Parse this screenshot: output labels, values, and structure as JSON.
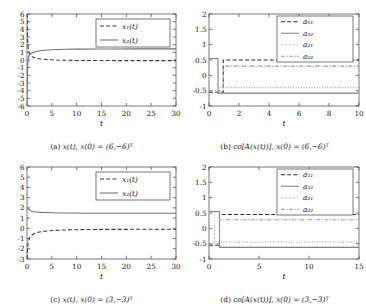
{
  "figure": {
    "panels": [
      {
        "tag": "(a)",
        "caption_main": "x(t), x(0) = (6,−6)",
        "caption_sup": "T",
        "xlabel": "t",
        "legend": [
          "x₁(t)",
          "x₂(t)"
        ]
      },
      {
        "tag": "(b)",
        "caption_main": "co[A(x(t))], x(0) = (6,−6)",
        "caption_sup": "T",
        "xlabel": "t",
        "legend": [
          "a₁₁",
          "a₁₂",
          "a₂₁",
          "a₂₂"
        ]
      },
      {
        "tag": "(c)",
        "caption_main": "x(t), x(0) = (3,−3)",
        "caption_sup": "T",
        "xlabel": "t",
        "legend": [
          "x₁(t)",
          "x₂(t)"
        ]
      },
      {
        "tag": "(d)",
        "caption_main": "co[A(x(t))], x(0) = (3,−3)",
        "caption_sup": "T",
        "xlabel": "t",
        "legend": [
          "a₁₁",
          "a₁₂",
          "a₂₁",
          "a₂₂"
        ]
      }
    ]
  },
  "chart_data": [
    {
      "type": "line",
      "title": "",
      "xlabel": "t",
      "ylabel": "",
      "xlim": [
        0,
        30
      ],
      "ylim": [
        -6,
        6
      ],
      "xticks": [
        0,
        5,
        10,
        15,
        20,
        25,
        30
      ],
      "yticks": [
        -6,
        -5,
        -4,
        -3,
        -2,
        -1,
        0,
        1,
        2,
        3,
        4,
        5,
        6
      ],
      "grid": false,
      "legend_position": "top-right",
      "series": [
        {
          "name": "x₁(t)",
          "style": "dashed",
          "color": "#3a3a3a",
          "x": [
            0,
            0.1,
            0.2,
            0.35,
            0.5,
            0.7,
            0.9,
            1.2,
            1.6,
            2,
            2.5,
            3,
            4,
            5,
            6,
            8,
            10,
            14,
            18,
            22,
            26,
            30
          ],
          "y": [
            6,
            3.1,
            1.85,
            1.15,
            0.85,
            0.62,
            0.5,
            0.38,
            0.28,
            0.22,
            0.16,
            0.12,
            0.06,
            0.02,
            -0.01,
            -0.04,
            -0.06,
            -0.07,
            -0.08,
            -0.08,
            -0.08,
            -0.08
          ]
        },
        {
          "name": "x₂(t)",
          "style": "solid",
          "color": "#6f6f6f",
          "x": [
            0,
            0.08,
            0.18,
            0.3,
            0.45,
            0.6,
            0.8,
            1,
            1.4,
            1.8,
            2.4,
            3,
            4,
            5,
            6,
            8,
            10,
            14,
            18,
            22,
            26,
            30
          ],
          "y": [
            -6,
            -2.1,
            -0.35,
            0.35,
            0.62,
            0.74,
            0.85,
            0.92,
            1.02,
            1.1,
            1.18,
            1.24,
            1.3,
            1.34,
            1.37,
            1.4,
            1.42,
            1.44,
            1.44,
            1.45,
            1.45,
            1.45
          ]
        }
      ]
    },
    {
      "type": "line",
      "title": "",
      "xlabel": "t",
      "ylabel": "",
      "xlim": [
        0,
        10
      ],
      "ylim": [
        -1,
        2
      ],
      "xticks": [
        0,
        2,
        4,
        6,
        8,
        10
      ],
      "yticks": [
        -1,
        -0.5,
        0,
        0.5,
        1,
        1.5,
        2
      ],
      "grid": false,
      "legend_position": "top-right",
      "series": [
        {
          "name": "a₁₁",
          "style": "dashed",
          "color": "#2b2b2b",
          "x": [
            0,
            0.95,
            0.95,
            10
          ],
          "y": [
            -0.55,
            -0.55,
            0.5,
            0.5
          ]
        },
        {
          "name": "a₁₂",
          "style": "solid",
          "color": "#808080",
          "x": [
            0,
            0.6,
            0.6,
            10
          ],
          "y": [
            0.55,
            0.55,
            -0.58,
            -0.58
          ]
        },
        {
          "name": "a₂₁",
          "style": "dotted",
          "color": "#b0b0b0",
          "x": [
            0,
            0.6,
            0.6,
            10
          ],
          "y": [
            0.5,
            0.5,
            -0.4,
            -0.4
          ]
        },
        {
          "name": "a₂₂",
          "style": "dashdot",
          "color": "#9a9a9a",
          "x": [
            0,
            0.95,
            0.95,
            10
          ],
          "y": [
            -0.5,
            -0.5,
            0.3,
            0.3
          ]
        }
      ]
    },
    {
      "type": "line",
      "title": "",
      "xlabel": "t",
      "ylabel": "",
      "xlim": [
        0,
        30
      ],
      "ylim": [
        -3,
        6
      ],
      "xticks": [
        0,
        5,
        10,
        15,
        20,
        25,
        30
      ],
      "yticks": [
        -3,
        -2,
        -1,
        0,
        1,
        2,
        3,
        4,
        5,
        6
      ],
      "grid": false,
      "legend_position": "top-right",
      "series": [
        {
          "name": "x₁(t)",
          "style": "dashed",
          "color": "#3a3a3a",
          "x": [
            0,
            0.15,
            0.3,
            0.5,
            0.8,
            1.2,
            1.8,
            2.5,
            3.5,
            5,
            7,
            9,
            12,
            16,
            20,
            25,
            30
          ],
          "y": [
            -3,
            -1.75,
            -1.25,
            -0.95,
            -0.72,
            -0.58,
            -0.45,
            -0.36,
            -0.28,
            -0.22,
            -0.17,
            -0.14,
            -0.12,
            -0.1,
            -0.1,
            -0.09,
            -0.09
          ]
        },
        {
          "name": "x₂(t)",
          "style": "solid",
          "color": "#6f6f6f",
          "x": [
            0,
            0.2,
            0.5,
            0.9,
            1.4,
            2,
            2.8,
            3.6,
            5,
            7,
            9,
            12,
            16,
            20,
            25,
            30
          ],
          "y": [
            2.05,
            1.95,
            1.8,
            1.7,
            1.63,
            1.59,
            1.56,
            1.54,
            1.52,
            1.5,
            1.49,
            1.48,
            1.48,
            1.47,
            1.47,
            1.47
          ]
        }
      ]
    },
    {
      "type": "line",
      "title": "",
      "xlabel": "t",
      "ylabel": "",
      "xlim": [
        0,
        15
      ],
      "ylim": [
        -1,
        2
      ],
      "xticks": [
        0,
        5,
        10,
        15
      ],
      "yticks": [
        -1,
        -0.5,
        0,
        0.5,
        1,
        1.5,
        2
      ],
      "grid": false,
      "legend_position": "top-right",
      "series": [
        {
          "name": "a₁₁",
          "style": "dashed",
          "color": "#2b2b2b",
          "x": [
            0,
            1.05,
            1.05,
            15
          ],
          "y": [
            -0.55,
            -0.55,
            0.45,
            0.45
          ]
        },
        {
          "name": "a₁₂",
          "style": "solid",
          "color": "#808080",
          "x": [
            0,
            1.05,
            1.05,
            15
          ],
          "y": [
            0.55,
            0.55,
            -0.62,
            -0.62
          ]
        },
        {
          "name": "a₂₁",
          "style": "dotted",
          "color": "#b0b0b0",
          "x": [
            0,
            0.55,
            0.55,
            15
          ],
          "y": [
            0.52,
            0.52,
            -0.45,
            -0.45
          ]
        },
        {
          "name": "a₂₂",
          "style": "dashdot",
          "color": "#9a9a9a",
          "x": [
            0,
            1.05,
            1.05,
            15
          ],
          "y": [
            -0.5,
            -0.5,
            0.28,
            0.28
          ]
        }
      ]
    }
  ]
}
